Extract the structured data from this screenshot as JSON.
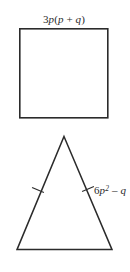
{
  "figure": {
    "background_color": "#ffffff",
    "stroke_color": "#2b2b2b",
    "text_color": "#2b2b2b",
    "square": {
      "name": "square",
      "label": "3p(p + q)",
      "label_parts": {
        "coefficient": "3",
        "variable": "p",
        "open_paren": "(",
        "inner_first": "p",
        "operator": " + ",
        "inner_second": "q",
        "close_paren": ")"
      },
      "x": 19,
      "y": 28,
      "width": 89,
      "height": 90,
      "label_x": 64,
      "label_y": 23
    },
    "triangle": {
      "name": "isosceles-triangle",
      "label": "6p2 - q",
      "label_parts": {
        "coefficient": "6",
        "variable": "p",
        "exponent": "2",
        "operator": " – ",
        "second_term": "q"
      },
      "apex_x": 64,
      "apex_y": 136,
      "base_left_x": 17,
      "base_left_y": 250,
      "base_right_x": 112,
      "base_right_y": 250,
      "label_x": 94,
      "label_y": 194,
      "tick_marks": {
        "count_per_leg": 1,
        "left_leg_tick_x": 38,
        "left_leg_tick_y": 190,
        "right_leg_tick_x": 88,
        "right_leg_tick_y": 189
      }
    }
  }
}
